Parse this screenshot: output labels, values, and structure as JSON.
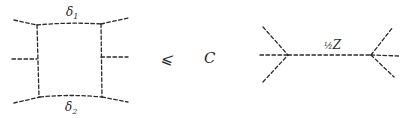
{
  "diagram": {
    "left_graph": {
      "description": "box diagram with four dashed internal edges and six external dashed legs",
      "top_label": "δ",
      "top_label_sub": "1",
      "bottom_label": "δ",
      "bottom_label_sub": "2"
    },
    "relation": "⩽",
    "constant": "C",
    "right_graph": {
      "description": "two vertices joined by a dashed edge, each with three external dashed legs",
      "edge_label_frac": "½",
      "edge_label": "Z"
    },
    "colors": {
      "ink": "#2a2a2a",
      "background": "#ffffff"
    }
  }
}
